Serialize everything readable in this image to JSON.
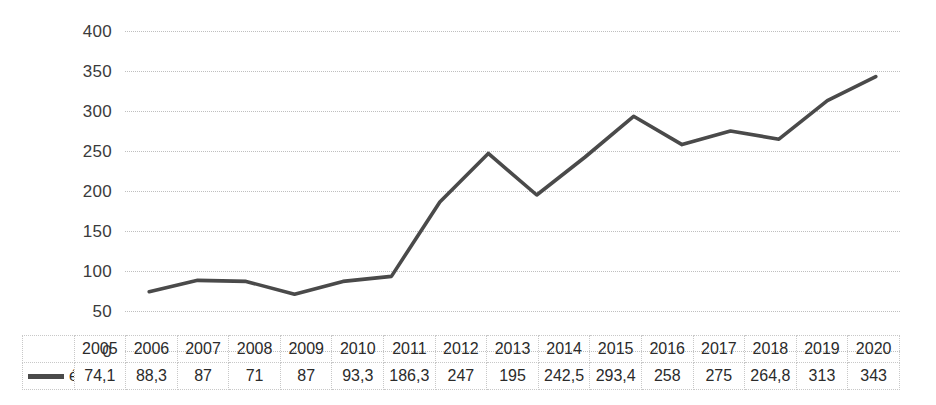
{
  "chart_data": {
    "type": "line",
    "title": "",
    "subtitle": "",
    "xlabel": "",
    "ylabel": "",
    "categories": [
      "2005",
      "2006",
      "2007",
      "2008",
      "2009",
      "2010",
      "2011",
      "2012",
      "2013",
      "2014",
      "2015",
      "2016",
      "2017",
      "2018",
      "2019",
      "2020"
    ],
    "series": [
      {
        "name": "éves+",
        "values": [
          74.1,
          88.3,
          87,
          71,
          87,
          93.3,
          186.3,
          247,
          195,
          242.5,
          293.4,
          258,
          275,
          264.8,
          313,
          343
        ],
        "value_labels": [
          "74,1",
          "88,3",
          "87",
          "71",
          "87",
          "93,3",
          "186,3",
          "247",
          "195",
          "242,5",
          "293,4",
          "258",
          "275",
          "264,8",
          "313",
          "343"
        ],
        "color": "#4a4a4a"
      }
    ],
    "ylim": [
      0,
      400
    ],
    "ytick_values": [
      400,
      350,
      300,
      250,
      200,
      150,
      100,
      50,
      0
    ],
    "ytick_labels": [
      "400",
      "350",
      "300",
      "250",
      "200",
      "150",
      "100",
      "50",
      "0"
    ],
    "grid": true,
    "grid_color": "#bfbfbf",
    "grid_style": "dotted",
    "legend_position": "data-table-row",
    "has_data_table": true,
    "data_table": {
      "header_row": [
        "2005",
        "2006",
        "2007",
        "2008",
        "2009",
        "2010",
        "2011",
        "2012",
        "2013",
        "2014",
        "2015",
        "2016",
        "2017",
        "2018",
        "2019",
        "2020"
      ],
      "value_row": [
        "74,1",
        "88,3",
        "87",
        "71",
        "87",
        "93,3",
        "186,3",
        "247",
        "195",
        "242,5",
        "293,4",
        "258",
        "275",
        "264,8",
        "313",
        "343"
      ],
      "row_label": "éves+"
    }
  },
  "legend": {
    "series_label": "éves+",
    "marker": "line-swatch"
  },
  "colors": {
    "line": "#4a4a4a",
    "grid": "#bfbfbf",
    "text": "#2b2b2b",
    "background": "#ffffff",
    "table_border": "#c8c8c8"
  }
}
